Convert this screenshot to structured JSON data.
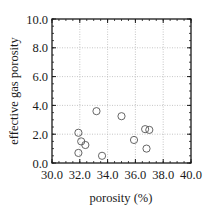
{
  "chart_data": {
    "type": "scatter",
    "title": "",
    "xlabel": "porosity (%)",
    "ylabel": "effective gas porosity",
    "xlim": [
      30.0,
      40.0
    ],
    "ylim": [
      0.0,
      10.0
    ],
    "xticks": [
      "30.0",
      "32.0",
      "34.0",
      "36.0",
      "38.0",
      "40.0"
    ],
    "yticks": [
      "0.0",
      "2.0",
      "4.0",
      "6.0",
      "8.0",
      "10.0"
    ],
    "grid": true,
    "legend": null,
    "marker": "open-circle",
    "series": [
      {
        "name": "samples",
        "points": [
          {
            "x": 31.9,
            "y": 2.1
          },
          {
            "x": 32.1,
            "y": 1.5
          },
          {
            "x": 32.4,
            "y": 1.25
          },
          {
            "x": 31.9,
            "y": 0.7
          },
          {
            "x": 33.6,
            "y": 0.5
          },
          {
            "x": 33.2,
            "y": 3.6
          },
          {
            "x": 35.0,
            "y": 3.25
          },
          {
            "x": 35.9,
            "y": 1.6
          },
          {
            "x": 36.7,
            "y": 2.35
          },
          {
            "x": 37.0,
            "y": 2.3
          },
          {
            "x": 36.8,
            "y": 1.0
          }
        ]
      }
    ]
  },
  "colors": {
    "axis": "#1a1a1a",
    "grid": "#b8b8b8",
    "marker_stroke": "#555555",
    "background": "#ffffff"
  }
}
